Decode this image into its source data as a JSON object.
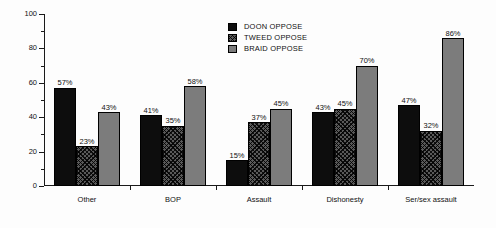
{
  "chart_data": {
    "type": "bar",
    "title": "",
    "subtitle": "",
    "xlabel": "",
    "ylabel": "",
    "ylim": [
      0,
      100
    ],
    "yticks": [
      0,
      20,
      40,
      60,
      80,
      100
    ],
    "ytick_labels": [
      "0",
      "20",
      "40",
      "60",
      "80",
      "100"
    ],
    "yminor_ticks": [
      10,
      30,
      50,
      70,
      90
    ],
    "grid": false,
    "legend_position": "top-center",
    "value_label_suffix": "%",
    "categories": [
      "Other",
      "BOP",
      "Assault",
      "Dishonesty",
      "Ser/sex assault"
    ],
    "series": [
      {
        "name": "DOON OPPOSE",
        "swatch": "solid-black",
        "color": "#0d0d0d",
        "values": [
          57,
          41,
          15,
          43,
          47
        ],
        "labels": [
          "57%",
          "41%",
          "15%",
          "43%",
          "47%"
        ]
      },
      {
        "name": "TWEED OPPOSE",
        "swatch": "checkered",
        "color": "#5a5a5a",
        "values": [
          23,
          35,
          37,
          45,
          32
        ],
        "labels": [
          "23%",
          "35%",
          "37%",
          "45%",
          "32%"
        ]
      },
      {
        "name": "BRAID OPPOSE",
        "swatch": "solid-gray",
        "color": "#7c7c7c",
        "values": [
          43,
          58,
          45,
          70,
          86
        ],
        "labels": [
          "43%",
          "58%",
          "45%",
          "70%",
          "86%"
        ]
      }
    ]
  }
}
